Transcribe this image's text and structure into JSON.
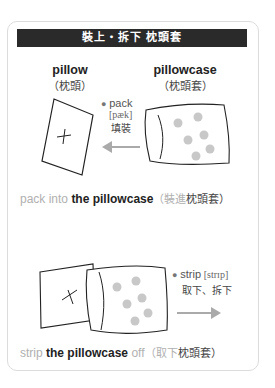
{
  "title": "裝上・拆下 枕頭套",
  "section1": {
    "pillow_en": "pillow",
    "pillow_zh": "（枕頭）",
    "pillowcase_en": "pillowcase",
    "pillowcase_zh": "（枕頭套）",
    "verb": "pack",
    "ipa": "[pæk]",
    "verb_zh": "填裝",
    "caption_gray": "pack into ",
    "caption_dark": "the pillowcase",
    "caption_zh_gray": "（裝進",
    "caption_zh_dark": "枕頭套）"
  },
  "section2": {
    "verb": "strip",
    "ipa": "[strɪp]",
    "verb_zh": "取下、拆下",
    "caption_gray1": "strip ",
    "caption_dark": "the pillowcase",
    "caption_gray2": " off",
    "caption_zh_gray": "（取下",
    "caption_zh_dark": "枕頭套）"
  },
  "colors": {
    "title_bg": "#2a2a2a",
    "dot": "#c8c8c8",
    "arrow": "#aaaaaa",
    "muted_text": "#b0b0b0"
  }
}
